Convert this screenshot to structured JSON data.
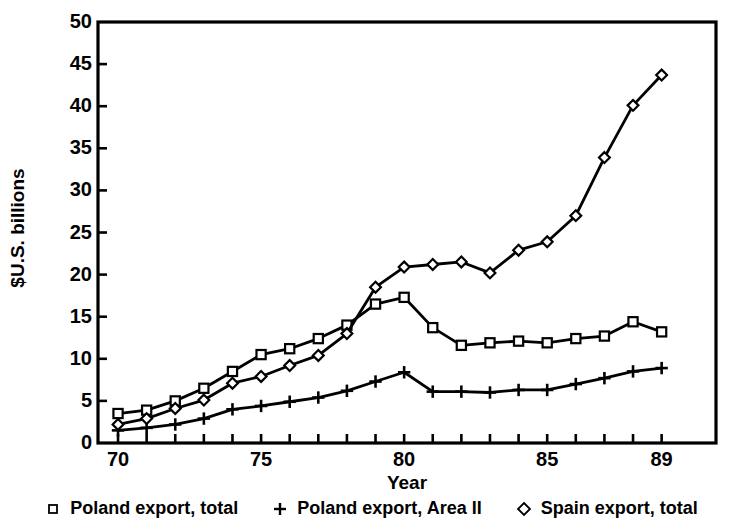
{
  "chart_data": {
    "type": "line",
    "title": "",
    "xlabel": "Year",
    "ylabel": "$U.S. billions",
    "x": [
      1970,
      1971,
      1972,
      1973,
      1974,
      1975,
      1976,
      1977,
      1978,
      1979,
      1980,
      1981,
      1982,
      1983,
      1984,
      1985,
      1986,
      1987,
      1988,
      1989
    ],
    "xtick_labels": [
      "70",
      "75",
      "80",
      "85",
      "89"
    ],
    "xtick_values": [
      1970,
      1975,
      1980,
      1985,
      1989
    ],
    "ytick_labels": [
      "0",
      "5",
      "10",
      "15",
      "20",
      "25",
      "30",
      "35",
      "40",
      "45",
      "50"
    ],
    "ytick_values": [
      0,
      5,
      10,
      15,
      20,
      25,
      30,
      35,
      40,
      45,
      50
    ],
    "xlim": [
      1969.3,
      1990.9
    ],
    "ylim": [
      0,
      50
    ],
    "grid": false,
    "legend_position": "bottom",
    "series": [
      {
        "name": "Poland export, total",
        "marker": "square",
        "color": "#000000",
        "values": [
          3.5,
          3.9,
          5.0,
          6.5,
          8.5,
          10.5,
          11.2,
          12.4,
          14.0,
          16.5,
          17.3,
          13.7,
          11.6,
          11.9,
          12.1,
          11.9,
          12.4,
          12.7,
          14.4,
          13.2
        ]
      },
      {
        "name": "Poland export, Area II",
        "marker": "plus",
        "color": "#000000",
        "values": [
          1.5,
          1.8,
          2.2,
          2.9,
          4.0,
          4.4,
          4.9,
          5.4,
          6.2,
          7.3,
          8.4,
          6.1,
          6.1,
          6.0,
          6.3,
          6.3,
          7.0,
          7.7,
          8.5,
          8.9
        ]
      },
      {
        "name": "Spain export, total",
        "marker": "diamond",
        "color": "#000000",
        "values": [
          2.2,
          2.9,
          4.1,
          5.1,
          7.1,
          7.9,
          9.2,
          10.4,
          13.0,
          18.5,
          20.9,
          21.2,
          21.5,
          20.2,
          22.9,
          23.9,
          27.0,
          33.9,
          40.1,
          43.7
        ]
      }
    ]
  },
  "axis": {
    "ylabel": "$U.S. billions",
    "xlabel": "Year"
  },
  "legend": {
    "items": [
      {
        "marker": "square-marker",
        "label": "Poland export, total"
      },
      {
        "marker": "plus-marker",
        "label": "Poland export, Area II"
      },
      {
        "marker": "diamond-marker",
        "label": "Spain export, total"
      }
    ]
  }
}
